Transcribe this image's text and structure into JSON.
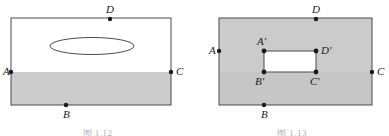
{
  "page": {
    "background_color": "#ffffff"
  },
  "style": {
    "shade_color": "#cbcbcb",
    "shade_color_alt": "#c6c6c6",
    "stroke_color": "#4a4a4a",
    "point_color": "#1a1a1a",
    "white_fill": "#ffffff"
  },
  "figures": [
    {
      "id": "figure-left",
      "caption": "图 1.12",
      "outer_rect": {
        "x": 11,
        "y": 18,
        "width": 160,
        "height": 87
      },
      "shaded_band": {
        "x": 11,
        "y": 72,
        "width": 160,
        "height": 33
      },
      "ellipse": {
        "cx": 92,
        "cy": 46,
        "rx": 42,
        "ry": 8.5
      },
      "points": [
        {
          "name": "A",
          "label": "A",
          "x": 11,
          "y": 72,
          "label_dx": -8,
          "label_dy": 3
        },
        {
          "name": "B",
          "label": "B",
          "x": 66,
          "y": 105,
          "label_dx": -2,
          "label_dy": 13
        },
        {
          "name": "C",
          "label": "C",
          "x": 171,
          "y": 72,
          "label_dx": 5,
          "label_dy": 3
        },
        {
          "name": "D",
          "label": "D",
          "x": 110,
          "y": 19,
          "label_dx": -2,
          "label_dy": -5
        }
      ]
    },
    {
      "id": "figure-right",
      "caption": "图 1.13",
      "outer_rect": {
        "x": 24,
        "y": 18,
        "width": 153,
        "height": 87
      },
      "shade_split_y": 72,
      "inner_hole": {
        "x": 69,
        "y": 51,
        "width": 52,
        "height": 21
      },
      "points": [
        {
          "name": "A",
          "label": "A",
          "x": 24,
          "y": 51,
          "label_dx": -9,
          "label_dy": 3
        },
        {
          "name": "B",
          "label": "B",
          "x": 69,
          "y": 105,
          "label_dx": -2,
          "label_dy": 13
        },
        {
          "name": "C",
          "label": "C",
          "x": 177,
          "y": 72,
          "label_dx": 5,
          "label_dy": 3
        },
        {
          "name": "D",
          "label": "D",
          "x": 121,
          "y": 19,
          "label_dx": -2,
          "label_dy": -5
        },
        {
          "name": "A-prime",
          "label": "A′",
          "x": 69,
          "y": 51,
          "label_dx": -4,
          "label_dy": -6
        },
        {
          "name": "B-prime",
          "label": "B′",
          "x": 69,
          "y": 72,
          "label_dx": -6,
          "label_dy": 12
        },
        {
          "name": "C-prime",
          "label": "C′",
          "x": 121,
          "y": 72,
          "label_dx": -2,
          "label_dy": 12
        },
        {
          "name": "D-prime",
          "label": "D′",
          "x": 121,
          "y": 51,
          "label_dx": 5,
          "label_dy": 3
        }
      ]
    }
  ]
}
